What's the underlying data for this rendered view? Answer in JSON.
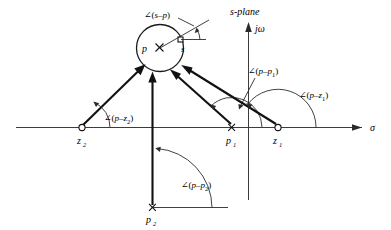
{
  "figure": {
    "plane_label": "s-plane",
    "axes": {
      "real_axis_label": "σ",
      "imag_axis_label": "jω"
    },
    "points": [
      {
        "id": "p",
        "label": "p",
        "type": "pole",
        "marker": "x",
        "x": 160,
        "y": 48
      },
      {
        "id": "s",
        "label": "s",
        "type": "test-point",
        "marker": "square",
        "x": 181,
        "y": 40
      },
      {
        "id": "z2",
        "label": "z",
        "sub": "2",
        "type": "zero",
        "marker": "circle",
        "x": 82,
        "y": 127
      },
      {
        "id": "p1",
        "label": "p",
        "sub": "1",
        "type": "pole",
        "marker": "x",
        "x": 232,
        "y": 127
      },
      {
        "id": "z1",
        "label": "z",
        "sub": "1",
        "type": "zero",
        "marker": "circle",
        "x": 278,
        "y": 127
      },
      {
        "id": "p2",
        "label": "p",
        "sub": "2",
        "type": "pole",
        "marker": "x",
        "x": 152,
        "y": 207
      }
    ],
    "angle_labels": [
      {
        "id": "angle-s-p",
        "prefix": "∠(",
        "expr": "s–p",
        "sub": "",
        "suffix": ")",
        "x": 149,
        "y": 15
      },
      {
        "id": "angle-p-p1",
        "prefix": "∠(",
        "expr": "p–p",
        "sub": "1",
        "suffix": ")",
        "x": 262,
        "y": 72
      },
      {
        "id": "angle-p-z1",
        "prefix": "∠(",
        "expr": "p–z",
        "sub": "1",
        "suffix": ")",
        "x": 296,
        "y": 96
      },
      {
        "id": "angle-p-z2",
        "prefix": "∠(",
        "expr": "p–z",
        "sub": "2",
        "suffix": ")",
        "x": 107,
        "y": 119
      },
      {
        "id": "angle-p-p2",
        "prefix": "∠(",
        "expr": "p–p",
        "sub": "2",
        "suffix": ")",
        "x": 183,
        "y": 185
      }
    ],
    "vectors": [
      {
        "id": "vector-z2-to-p",
        "from": "z2",
        "to": "p"
      },
      {
        "id": "vector-p2-to-p",
        "from": "p2",
        "to": "p"
      },
      {
        "id": "vector-p1-to-p",
        "from": "p1",
        "to": "p"
      },
      {
        "id": "vector-z1-to-p",
        "from": "z1",
        "to": "p"
      }
    ],
    "colors": {
      "ink": "#111111",
      "axis": "#3c3c3c",
      "background": "#ffffff"
    }
  }
}
